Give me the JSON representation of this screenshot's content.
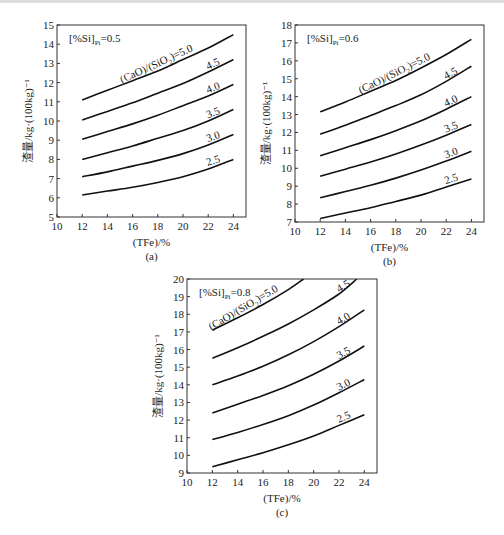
{
  "chart_data": [
    {
      "id": "a",
      "type": "line",
      "caption": "(a)",
      "annotation": "[%Si]Pi=0.5",
      "xlabel": "(TFe)/%",
      "ylabel": "渣量/kg·(100kg)⁻¹",
      "xlim": [
        10,
        25
      ],
      "ylim": [
        5,
        15
      ],
      "xticks": [
        10,
        12,
        14,
        16,
        18,
        20,
        22,
        24
      ],
      "yticks": [
        5,
        6,
        7,
        8,
        9,
        10,
        11,
        12,
        13,
        14,
        15
      ],
      "grid": false,
      "series": [
        {
          "name": "(CaO)/(SiO2)=5.0",
          "label": "(CaO)/(SiO₂)=5.0",
          "x": [
            12,
            14,
            16,
            18,
            20,
            22,
            24
          ],
          "y": [
            11.1,
            11.6,
            12.1,
            12.6,
            13.2,
            13.8,
            14.5
          ]
        },
        {
          "name": "4.5",
          "label": "4.5",
          "x": [
            12,
            14,
            16,
            18,
            20,
            22,
            24
          ],
          "y": [
            10.05,
            10.5,
            10.95,
            11.45,
            11.95,
            12.55,
            13.2
          ]
        },
        {
          "name": "4.0",
          "label": "4.0",
          "x": [
            12,
            14,
            16,
            18,
            20,
            22,
            24
          ],
          "y": [
            9.05,
            9.45,
            9.85,
            10.3,
            10.8,
            11.3,
            11.9
          ]
        },
        {
          "name": "3.5",
          "label": "3.5",
          "x": [
            12,
            14,
            16,
            18,
            20,
            22,
            24
          ],
          "y": [
            8.0,
            8.35,
            8.7,
            9.1,
            9.5,
            10.0,
            10.6
          ]
        },
        {
          "name": "3.0",
          "label": "3.0",
          "x": [
            12,
            14,
            16,
            18,
            20,
            22,
            24
          ],
          "y": [
            7.1,
            7.35,
            7.65,
            7.95,
            8.3,
            8.75,
            9.3
          ]
        },
        {
          "name": "2.5",
          "label": "2.5",
          "x": [
            12,
            14,
            16,
            18,
            20,
            22,
            24
          ],
          "y": [
            6.15,
            6.35,
            6.55,
            6.8,
            7.1,
            7.5,
            8.0
          ]
        }
      ]
    },
    {
      "id": "b",
      "type": "line",
      "caption": "(b)",
      "annotation": "[%Si]Pi=0.6",
      "xlabel": "(TFe)/%",
      "ylabel": "渣量/kg·(100kg)⁻¹",
      "xlim": [
        10,
        25
      ],
      "ylim": [
        7,
        18
      ],
      "xticks": [
        10,
        12,
        14,
        16,
        18,
        20,
        22,
        24
      ],
      "yticks": [
        7,
        8,
        9,
        10,
        11,
        12,
        13,
        14,
        15,
        16,
        17,
        18
      ],
      "grid": false,
      "series": [
        {
          "name": "(CaO)/(SiO2)=5.0",
          "label": "(CaO)/(SiO₂)=5.0",
          "x": [
            12,
            14,
            16,
            18,
            20,
            22,
            24
          ],
          "y": [
            13.15,
            13.7,
            14.3,
            14.9,
            15.6,
            16.35,
            17.2
          ]
        },
        {
          "name": "4.5",
          "label": "4.5",
          "x": [
            12,
            14,
            16,
            18,
            20,
            22,
            24
          ],
          "y": [
            11.9,
            12.4,
            12.95,
            13.5,
            14.1,
            14.85,
            15.7
          ]
        },
        {
          "name": "4.0",
          "label": "4.0",
          "x": [
            12,
            14,
            16,
            18,
            20,
            22,
            24
          ],
          "y": [
            10.7,
            11.15,
            11.6,
            12.1,
            12.65,
            13.3,
            14.0
          ]
        },
        {
          "name": "3.5",
          "label": "3.5",
          "x": [
            12,
            14,
            16,
            18,
            20,
            22,
            24
          ],
          "y": [
            9.55,
            9.95,
            10.35,
            10.8,
            11.3,
            11.85,
            12.45
          ]
        },
        {
          "name": "3.0",
          "label": "3.0",
          "x": [
            12,
            14,
            16,
            18,
            20,
            22,
            24
          ],
          "y": [
            8.35,
            8.7,
            9.05,
            9.45,
            9.9,
            10.4,
            10.95
          ]
        },
        {
          "name": "2.5",
          "label": "2.5",
          "x": [
            12,
            14,
            16,
            18,
            20,
            22,
            24
          ],
          "y": [
            7.2,
            7.5,
            7.8,
            8.15,
            8.5,
            8.95,
            9.4
          ]
        }
      ]
    },
    {
      "id": "c",
      "type": "line",
      "caption": "(c)",
      "annotation": "[%Si]Pi=0.8",
      "xlabel": "(TFe)/%",
      "ylabel": "渣量/kg·(100kg)⁻¹",
      "xlim": [
        10,
        25
      ],
      "ylim": [
        9,
        20
      ],
      "xticks": [
        10,
        12,
        14,
        16,
        18,
        20,
        22,
        24
      ],
      "yticks": [
        9,
        10,
        11,
        12,
        13,
        14,
        15,
        16,
        17,
        18,
        19,
        20
      ],
      "grid": false,
      "series": [
        {
          "name": "(CaO)/(SiO2)=5.0",
          "label": "(CaO)/(SiO₂)=5.0",
          "x": [
            12,
            14,
            16,
            18,
            19.2
          ],
          "y": [
            17.1,
            17.8,
            18.55,
            19.4,
            20.0
          ]
        },
        {
          "name": "4.5",
          "label": "4.5",
          "x": [
            12,
            14,
            16,
            18,
            20,
            22,
            23.4
          ],
          "y": [
            15.5,
            16.1,
            16.75,
            17.45,
            18.25,
            19.15,
            20.0
          ]
        },
        {
          "name": "4.0",
          "label": "4.0",
          "x": [
            12,
            14,
            16,
            18,
            20,
            22,
            24
          ],
          "y": [
            14.0,
            14.5,
            15.05,
            15.7,
            16.45,
            17.3,
            18.25
          ]
        },
        {
          "name": "3.5",
          "label": "3.5",
          "x": [
            12,
            14,
            16,
            18,
            20,
            22,
            24
          ],
          "y": [
            12.4,
            12.9,
            13.4,
            13.95,
            14.6,
            15.35,
            16.2
          ]
        },
        {
          "name": "3.0",
          "label": "3.0",
          "x": [
            12,
            14,
            16,
            18,
            20,
            22,
            24
          ],
          "y": [
            10.9,
            11.3,
            11.75,
            12.25,
            12.85,
            13.55,
            14.3
          ]
        },
        {
          "name": "2.5",
          "label": "2.5",
          "x": [
            12,
            14,
            16,
            18,
            20,
            22,
            24
          ],
          "y": [
            9.35,
            9.75,
            10.15,
            10.6,
            11.1,
            11.7,
            12.3
          ]
        }
      ]
    }
  ]
}
